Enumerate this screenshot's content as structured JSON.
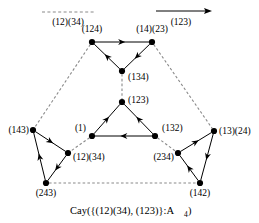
{
  "figure": {
    "caption": {
      "main": "Cay({(12)(34), (123)}:A",
      "subscript": "4",
      "close": ")"
    },
    "legend": [
      {
        "name": "legend-dashed",
        "label": "(12)(34)",
        "style": "dashed",
        "arrow": false
      },
      {
        "name": "legend-solid",
        "label": "(123)",
        "style": "solid",
        "arrow": true
      }
    ],
    "vertices": [
      {
        "id": "v124",
        "label": "(124)",
        "x": 92,
        "y": 42,
        "lx": 92,
        "ly": 32,
        "anchor": "middle"
      },
      {
        "id": "v1423",
        "label": "(14)(23)",
        "x": 152,
        "y": 42,
        "lx": 152,
        "ly": 32,
        "anchor": "middle"
      },
      {
        "id": "v134",
        "label": "(134)",
        "x": 122,
        "y": 71,
        "lx": 128,
        "ly": 80,
        "anchor": "start"
      },
      {
        "id": "v123",
        "label": "(123)",
        "x": 122,
        "y": 102,
        "lx": 128,
        "ly": 103,
        "anchor": "start"
      },
      {
        "id": "v1",
        "label": "(1)",
        "x": 92,
        "y": 136,
        "lx": 86,
        "ly": 131,
        "anchor": "end"
      },
      {
        "id": "v132",
        "label": "(132)",
        "x": 155,
        "y": 136,
        "lx": 162,
        "ly": 131,
        "anchor": "start"
      },
      {
        "id": "v143",
        "label": "(143)",
        "x": 33,
        "y": 130,
        "lx": 29,
        "ly": 133,
        "anchor": "end"
      },
      {
        "id": "v1324",
        "label": "(13)(24)",
        "x": 214,
        "y": 131,
        "lx": 219,
        "ly": 134,
        "anchor": "start"
      },
      {
        "id": "v1234",
        "label": "(12)(34)",
        "x": 68,
        "y": 153,
        "lx": 73,
        "ly": 160,
        "anchor": "start"
      },
      {
        "id": "v234",
        "label": "(234)",
        "x": 178,
        "y": 153,
        "lx": 174,
        "ly": 160,
        "anchor": "end"
      },
      {
        "id": "v243",
        "label": "(243)",
        "x": 46,
        "y": 183,
        "lx": 46,
        "ly": 196,
        "anchor": "middle"
      },
      {
        "id": "v142",
        "label": "(142)",
        "x": 200,
        "y": 183,
        "lx": 200,
        "ly": 196,
        "anchor": "middle"
      }
    ],
    "edges": [
      {
        "name": "edge-124-to-1423",
        "from": "v124",
        "to": "v1423",
        "style": "solid",
        "arrow": "forward"
      },
      {
        "name": "edge-1423-to-134",
        "from": "v1423",
        "to": "v134",
        "style": "solid",
        "arrow": "forward"
      },
      {
        "name": "edge-134-to-124",
        "from": "v134",
        "to": "v124",
        "style": "solid",
        "arrow": "forward"
      },
      {
        "name": "edge-134-to-123",
        "from": "v134",
        "to": "v123",
        "style": "dashed",
        "arrow": "none"
      },
      {
        "name": "edge-123-to-1",
        "from": "v123",
        "to": "v1",
        "style": "solid",
        "arrow": "backward"
      },
      {
        "name": "edge-132-to-123",
        "from": "v132",
        "to": "v123",
        "style": "solid",
        "arrow": "forward"
      },
      {
        "name": "edge-132-to-1",
        "from": "v132",
        "to": "v1",
        "style": "solid",
        "arrow": "forward"
      },
      {
        "name": "edge-124-to-143",
        "from": "v124",
        "to": "v143",
        "style": "dashed",
        "arrow": "none"
      },
      {
        "name": "edge-1423-to-1324",
        "from": "v1423",
        "to": "v1324",
        "style": "dashed",
        "arrow": "none"
      },
      {
        "name": "edge-1-to-1234",
        "from": "v1",
        "to": "v1234",
        "style": "dashed",
        "arrow": "none"
      },
      {
        "name": "edge-132-to-234",
        "from": "v132",
        "to": "v234",
        "style": "dashed",
        "arrow": "none"
      },
      {
        "name": "edge-143-to-1234",
        "from": "v143",
        "to": "v1234",
        "style": "solid",
        "arrow": "forward"
      },
      {
        "name": "edge-1234-to-243",
        "from": "v1234",
        "to": "v243",
        "style": "solid",
        "arrow": "forward"
      },
      {
        "name": "edge-243-to-143",
        "from": "v243",
        "to": "v143",
        "style": "solid",
        "arrow": "forward"
      },
      {
        "name": "edge-234-to-1324",
        "from": "v234",
        "to": "v1324",
        "style": "solid",
        "arrow": "forward"
      },
      {
        "name": "edge-1324-to-142",
        "from": "v1324",
        "to": "v142",
        "style": "solid",
        "arrow": "forward"
      },
      {
        "name": "edge-142-to-234",
        "from": "v142",
        "to": "v234",
        "style": "solid",
        "arrow": "forward"
      },
      {
        "name": "edge-243-to-142",
        "from": "v243",
        "to": "v142",
        "style": "dashed",
        "arrow": "none"
      }
    ],
    "colors": {
      "stroke": "#000000",
      "dashed_stroke": "#8a8a8a",
      "background": "#ffffff"
    }
  }
}
